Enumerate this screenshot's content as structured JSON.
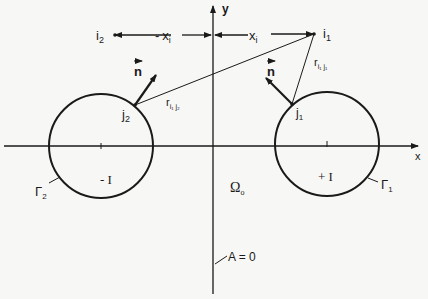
{
  "diagram": {
    "axes": {
      "x_label": "x",
      "y_label": "y"
    },
    "points": {
      "i1": {
        "base": "i",
        "sub": "1"
      },
      "i2": {
        "base": "i",
        "sub": "2"
      },
      "j1": {
        "base": "j",
        "sub": "1"
      },
      "j2": {
        "base": "j",
        "sub": "2"
      }
    },
    "distances": {
      "xi_pos": {
        "base": "x",
        "sub": "i"
      },
      "xi_neg": {
        "prefix": "-",
        "base": "x",
        "sub": "i"
      },
      "r_i1j1": {
        "base": "r",
        "sub": "i₁ j₁"
      },
      "r_i1j2": {
        "base": "r",
        "sub": "i₁ j₂"
      }
    },
    "normal_label": "n",
    "contours": {
      "gamma1": {
        "base": "Γ",
        "sub": "1",
        "current": "+ I"
      },
      "gamma2": {
        "base": "Γ",
        "sub": "2",
        "current": "- I"
      }
    },
    "region_label": {
      "base": "Ω",
      "sub": "o"
    },
    "boundary_condition": "A = 0"
  }
}
